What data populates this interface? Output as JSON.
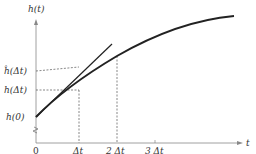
{
  "diagram": {
    "y_axis_label": "h(t)",
    "x_axis_label": "t",
    "y_labels": {
      "h_hat": "ĥ(Δt)",
      "h_dt": "h(Δt)",
      "h0": "h(0)"
    },
    "x_ticks": [
      "0",
      "Δt",
      "2 Δt",
      "3 Δt"
    ],
    "colors": {
      "ink": "#222222",
      "dash": "#555555"
    }
  }
}
